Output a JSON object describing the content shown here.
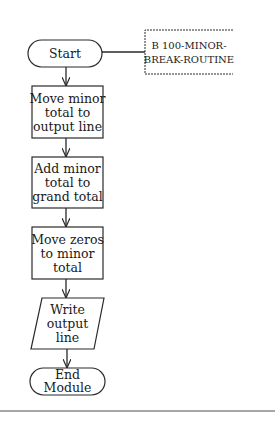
{
  "diagram": {
    "type": "flowchart",
    "nodes": [
      {
        "id": "start",
        "shape": "terminator",
        "lines": [
          "Start"
        ]
      },
      {
        "id": "move-minor",
        "shape": "process",
        "lines": [
          "Move minor",
          "total to",
          "output line"
        ]
      },
      {
        "id": "add-minor",
        "shape": "process",
        "lines": [
          "Add minor",
          "total to",
          "grand total"
        ]
      },
      {
        "id": "move-zeros",
        "shape": "process",
        "lines": [
          "Move zeros",
          "to minor",
          "total"
        ]
      },
      {
        "id": "write-output",
        "shape": "io",
        "lines": [
          "Write",
          "output",
          "line"
        ]
      },
      {
        "id": "end",
        "shape": "terminator",
        "lines": [
          "End",
          "Module"
        ]
      }
    ],
    "annotation": {
      "attached_to": "start",
      "lines": [
        "B 100-MINOR-",
        "BREAK-ROUTINE"
      ]
    },
    "edges": [
      {
        "from": "start",
        "to": "move-minor"
      },
      {
        "from": "move-minor",
        "to": "add-minor"
      },
      {
        "from": "add-minor",
        "to": "move-zeros"
      },
      {
        "from": "move-zeros",
        "to": "write-output"
      },
      {
        "from": "write-output",
        "to": "end"
      }
    ],
    "colors": {
      "stroke": "#2a2a2a",
      "text": "#1a1a1a",
      "rule": "#8a8a8a",
      "background": "#ffffff"
    }
  }
}
